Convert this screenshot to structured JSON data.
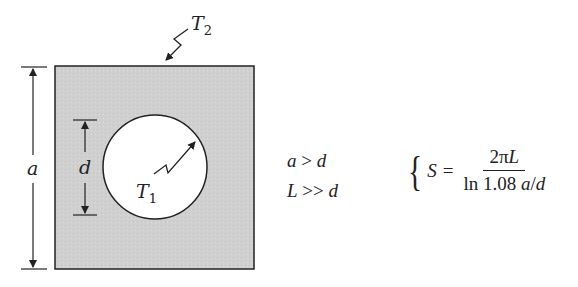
{
  "diagram": {
    "labels": {
      "outer_temperature": "T",
      "outer_temperature_sub": "2",
      "inner_temperature": "T",
      "inner_temperature_sub": "1",
      "outer_dimension": "a",
      "inner_dimension": "d"
    },
    "conditions": [
      {
        "lhs": "a",
        "op": ">",
        "rhs": "d"
      },
      {
        "lhs": "L",
        "op": ">>",
        "rhs": "d"
      }
    ],
    "formula": {
      "lhs": "S",
      "equals": "=",
      "numerator_coeff": "2π",
      "numerator_var": "L",
      "denominator_fn": "ln 1.08",
      "denominator_var1": "a",
      "denominator_slash": "/",
      "denominator_var2": "d"
    },
    "colors": {
      "solid_fill": "#d0d0d0",
      "stroke": "#222222",
      "hole_fill": "#ffffff"
    }
  }
}
